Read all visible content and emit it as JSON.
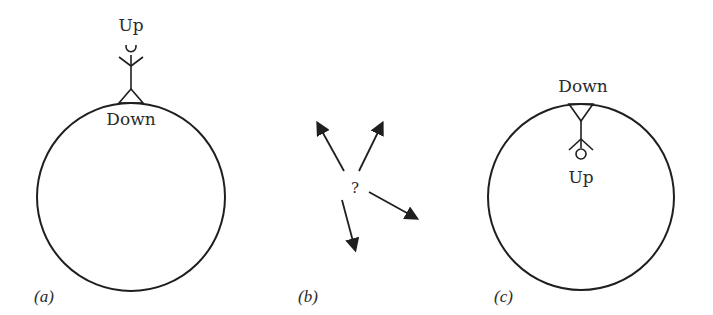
{
  "diagram": {
    "panels": [
      {
        "id": "a",
        "caption": "(a)",
        "labels": {
          "top": "Up",
          "bottom": "Down"
        },
        "description": "Stick figure standing upright on top of a circle (globe)"
      },
      {
        "id": "b",
        "caption": "(b)",
        "center_label": "?",
        "arrow_count": 4,
        "description": "Four arrows pointing in different directions from a question mark"
      },
      {
        "id": "c",
        "caption": "(c)",
        "labels": {
          "top": "Down",
          "bottom": "Up"
        },
        "description": "Stick figure hanging upside down from the inside top of a circle"
      }
    ],
    "colors": {
      "line": "#1f1f1f",
      "text": "#2a2a2a",
      "background": "#ffffff"
    }
  }
}
